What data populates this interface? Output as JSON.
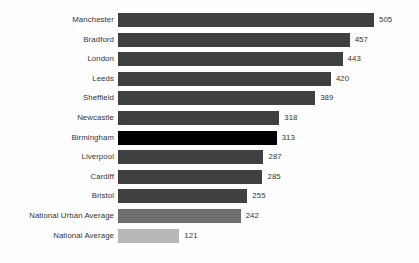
{
  "chart_data": {
    "type": "bar",
    "orientation": "horizontal",
    "title": "",
    "subtitle": "",
    "xlabel": "",
    "ylabel": "",
    "grid": false,
    "legend": null,
    "xlim": [
      0,
      505
    ],
    "axis_visible": false,
    "tick_labels": [],
    "value_labels_shown": true,
    "categories": [
      "Manchester",
      "Bradford",
      "London",
      "Leeds",
      "Sheffield",
      "Newcastle",
      "Birmingham",
      "Liverpool",
      "Cardiff",
      "Bristol",
      "National Urban Average",
      "National Average"
    ],
    "values": [
      505,
      457,
      443,
      420,
      389,
      318,
      313,
      287,
      285,
      255,
      242,
      121
    ],
    "bars": [
      {
        "label": "Manchester",
        "value": 505,
        "value_text": "505",
        "style": "dark"
      },
      {
        "label": "Bradford",
        "value": 457,
        "value_text": "457",
        "style": "dark"
      },
      {
        "label": "London",
        "value": 443,
        "value_text": "443",
        "style": "dark"
      },
      {
        "label": "Leeds",
        "value": 420,
        "value_text": "420",
        "style": "dark"
      },
      {
        "label": "Sheffield",
        "value": 389,
        "value_text": "389",
        "style": "dark"
      },
      {
        "label": "Newcastle",
        "value": 318,
        "value_text": "318",
        "style": "dark"
      },
      {
        "label": "Birmingham",
        "value": 313,
        "value_text": "313",
        "style": "highlight"
      },
      {
        "label": "Liverpool",
        "value": 287,
        "value_text": "287",
        "style": "dark"
      },
      {
        "label": "Cardiff",
        "value": 285,
        "value_text": "285",
        "style": "dark"
      },
      {
        "label": "Bristol",
        "value": 255,
        "value_text": "255",
        "style": "dark"
      },
      {
        "label": "National Urban Average",
        "value": 242,
        "value_text": "242",
        "style": "mid"
      },
      {
        "label": "National Average",
        "value": 121,
        "value_text": "121",
        "style": "light"
      }
    ],
    "colors": {
      "bar_dark": "#404040",
      "bar_highlight": "#000000",
      "bar_mid": "#6e6e6e",
      "bar_light": "#b8b8b8",
      "background": "#fefefe",
      "text": "#333333"
    }
  }
}
